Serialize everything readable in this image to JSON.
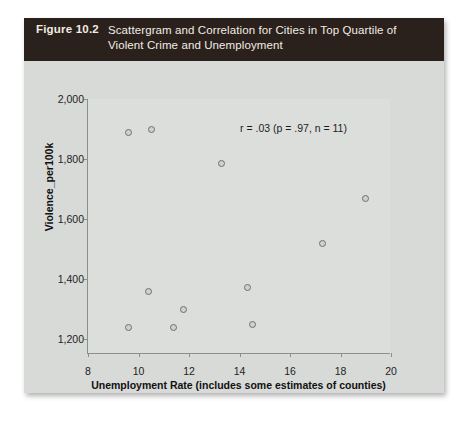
{
  "figure": {
    "number_label": "Figure 10.2",
    "caption_line1": "Scattergram and Correlation for Cities in Top Quartile of",
    "caption_line2": "Violent Crime and Unemployment",
    "header_bg": "#2a211c",
    "header_text_color": "#f2ece4",
    "panel_bg": "#d8dad8",
    "plot_bg": "#dcdedc",
    "axis_color": "#8d8f8d",
    "marker_edge_color": "#6d6f6d"
  },
  "chart_data": {
    "type": "scatter",
    "title": "Scattergram and Correlation for Cities in Top Quartile of Violent Crime and Unemployment",
    "xlabel": "Unemployment Rate (includes some estimates of counties)",
    "ylabel": "Violence_per100k",
    "xlim": [
      8,
      20
    ],
    "ylim": [
      1150,
      2000
    ],
    "xticks": [
      8,
      10,
      12,
      14,
      16,
      18,
      20
    ],
    "xtick_labels": [
      "8",
      "10",
      "12",
      "14",
      "16",
      "18",
      "20"
    ],
    "yticks": [
      1200,
      1400,
      1600,
      1800,
      2000
    ],
    "ytick_labels": [
      "1,200",
      "1,400",
      "1,600",
      "1,800",
      "2,000"
    ],
    "grid": false,
    "legend": null,
    "annotation": "r = .03 (p = .97, n = 11)",
    "statistics": {
      "r": 0.03,
      "p": 0.97,
      "n": 11
    },
    "x": [
      9.6,
      9.6,
      10.4,
      10.5,
      11.4,
      11.8,
      13.3,
      14.3,
      14.5,
      17.3,
      19.0
    ],
    "y": [
      1888,
      1237,
      1358,
      1900,
      1237,
      1297,
      1785,
      1372,
      1247,
      1518,
      1668
    ],
    "points": [
      {
        "x": 9.6,
        "y": 1888
      },
      {
        "x": 9.6,
        "y": 1237
      },
      {
        "x": 10.4,
        "y": 1358
      },
      {
        "x": 10.5,
        "y": 1900
      },
      {
        "x": 11.4,
        "y": 1237
      },
      {
        "x": 11.8,
        "y": 1297
      },
      {
        "x": 13.3,
        "y": 1785
      },
      {
        "x": 14.3,
        "y": 1372
      },
      {
        "x": 14.5,
        "y": 1247
      },
      {
        "x": 17.3,
        "y": 1518
      },
      {
        "x": 19.0,
        "y": 1668
      }
    ]
  }
}
